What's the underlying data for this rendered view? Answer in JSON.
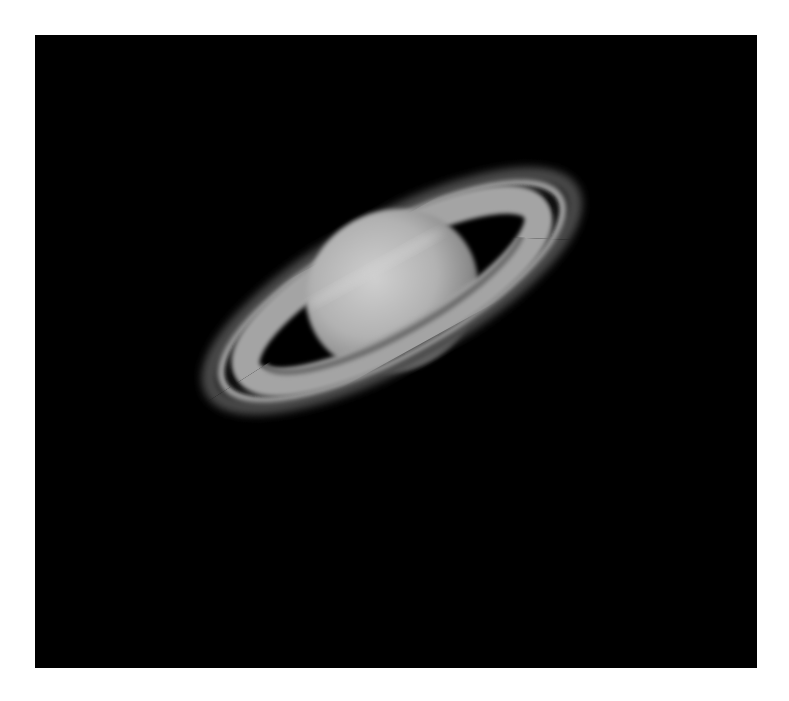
{
  "image": {
    "subject": "Saturn",
    "description": "Grayscale telescope image of Saturn with its rings tilted, on a black background",
    "colors": {
      "background": "#000000",
      "page": "#ffffff",
      "planet": "#b8b8b8",
      "rings": "#a8a8a8"
    }
  }
}
